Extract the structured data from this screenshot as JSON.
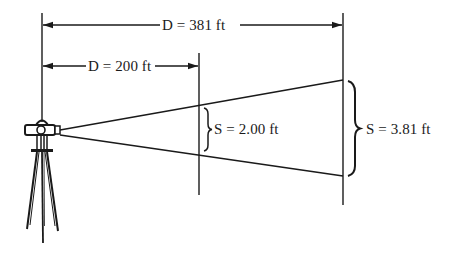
{
  "figure": {
    "colors": {
      "ink": "#1a1a1a",
      "background": "#ffffff"
    },
    "distances": [
      {
        "id": "far",
        "label": "D = 381 ft",
        "value": 381,
        "unit": "ft"
      },
      {
        "id": "near",
        "label": "D = 200 ft",
        "value": 200,
        "unit": "ft"
      }
    ],
    "intercepts": [
      {
        "id": "near",
        "label": "S = 2.00 ft",
        "value": 2.0,
        "unit": "ft"
      },
      {
        "id": "far",
        "label": "S = 3.81 ft",
        "value": 3.81,
        "unit": "ft"
      }
    ],
    "instrument": "surveying-level-on-tripod"
  }
}
